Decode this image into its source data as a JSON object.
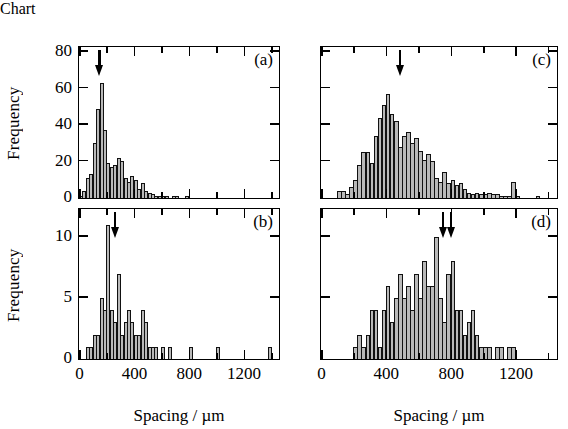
{
  "figure": {
    "xlabel": "Spacing / µm",
    "ylabel": "Frequency",
    "xticks": [
      "0",
      "400",
      "800",
      "1200"
    ],
    "xlim": [
      0,
      1450
    ],
    "ink_color": "#000000",
    "bar_fill": "#b9b9b9"
  },
  "axis_titles": {
    "left_x": "Spacing / µm",
    "right_x": "Spacing / µm",
    "top_left_y": "Frequency",
    "bottom_left_y": "Frequency"
  },
  "chart_data": [
    {
      "type": "bar",
      "panel": "a",
      "label": "(a)",
      "title": "",
      "xlabel": "Spacing / µm",
      "ylabel": "Frequency",
      "xlim": [
        0,
        1450
      ],
      "ylim": [
        0,
        82
      ],
      "xticks": [
        0,
        400,
        800,
        1200
      ],
      "xticks_minor": [
        200,
        600,
        1000,
        1400
      ],
      "yticks": [
        0,
        20,
        40,
        60,
        80
      ],
      "ytick_labels": [
        "0",
        "20",
        "40",
        "60",
        "80"
      ],
      "grid": false,
      "legend": null,
      "bin_width": 25,
      "annotation_arrows": [
        150
      ],
      "x": [
        25,
        50,
        75,
        100,
        125,
        150,
        175,
        200,
        225,
        250,
        275,
        300,
        325,
        350,
        375,
        400,
        425,
        450,
        475,
        500,
        525,
        550,
        575,
        600,
        625,
        650,
        675,
        700,
        725,
        750,
        775,
        800,
        825,
        850,
        875,
        900,
        925,
        950,
        975,
        1000,
        1025,
        1050,
        1075,
        1100,
        1125,
        1150,
        1175,
        1200
      ],
      "values": [
        1,
        4,
        11,
        13,
        30,
        49,
        63,
        37,
        19,
        17,
        18,
        22,
        20,
        11,
        9,
        12,
        10,
        5,
        8,
        4,
        3,
        2,
        1,
        1,
        1,
        1,
        0,
        1,
        1,
        0,
        0,
        1,
        0,
        0,
        0,
        0,
        0,
        0,
        0,
        0,
        0,
        0,
        0,
        0,
        0,
        0,
        0,
        0
      ]
    },
    {
      "type": "bar",
      "panel": "b",
      "label": "(b)",
      "title": "",
      "xlabel": "Spacing / µm",
      "ylabel": "Frequency",
      "xlim": [
        0,
        1450
      ],
      "ylim": [
        0,
        12.2
      ],
      "xticks": [
        0,
        400,
        800,
        1200
      ],
      "xticks_minor": [
        200,
        600,
        1000,
        1400
      ],
      "yticks": [
        0,
        5,
        10
      ],
      "ytick_labels": [
        "0",
        "5",
        "10"
      ],
      "grid": false,
      "legend": null,
      "bin_width": 25,
      "annotation_arrows": [
        265
      ],
      "x": [
        25,
        50,
        75,
        100,
        125,
        150,
        175,
        200,
        225,
        250,
        275,
        300,
        325,
        350,
        375,
        400,
        425,
        450,
        475,
        500,
        525,
        550,
        575,
        600,
        625,
        650,
        675,
        700,
        725,
        750,
        775,
        800,
        825,
        850,
        875,
        900,
        925,
        950,
        975,
        1000,
        1025,
        1050,
        1075,
        1100,
        1125,
        1150,
        1175,
        1200,
        1225,
        1250,
        1275,
        1300,
        1325,
        1350,
        1375,
        1400
      ],
      "values": [
        0,
        0,
        1,
        1,
        2,
        2,
        5,
        4,
        11,
        4,
        3,
        7,
        2,
        3,
        4,
        3,
        2,
        2,
        4,
        3,
        1,
        1,
        1,
        0,
        1,
        0,
        1,
        0,
        0,
        0,
        0,
        0,
        1,
        0,
        0,
        0,
        0,
        0,
        0,
        0,
        1,
        0,
        0,
        0,
        0,
        0,
        0,
        0,
        0,
        0,
        0,
        0,
        0,
        0,
        0,
        1
      ]
    },
    {
      "type": "bar",
      "panel": "c",
      "label": "(c)",
      "title": "",
      "xlabel": "Spacing / µm",
      "ylabel": "Frequency",
      "xlim": [
        0,
        1450
      ],
      "ylim": [
        0,
        82
      ],
      "xticks": [
        0,
        400,
        800,
        1200
      ],
      "xticks_minor": [
        200,
        600,
        1000,
        1400
      ],
      "yticks": [
        0,
        20,
        40,
        60,
        80
      ],
      "ytick_labels": [
        "0",
        "20",
        "40",
        "60",
        "80"
      ],
      "grid": false,
      "legend": null,
      "bin_width": 25,
      "annotation_arrows": [
        490
      ],
      "x": [
        125,
        150,
        175,
        200,
        225,
        250,
        275,
        300,
        325,
        350,
        375,
        400,
        425,
        450,
        475,
        500,
        525,
        550,
        575,
        600,
        625,
        650,
        675,
        700,
        725,
        750,
        775,
        800,
        825,
        850,
        875,
        900,
        925,
        950,
        975,
        1000,
        1025,
        1050,
        1075,
        1100,
        1125,
        1150,
        1175,
        1200,
        1225,
        1250,
        1275,
        1300,
        1325,
        1350
      ],
      "values": [
        4,
        4,
        2,
        6,
        10,
        18,
        25,
        25,
        19,
        34,
        44,
        51,
        57,
        46,
        42,
        28,
        34,
        36,
        30,
        33,
        26,
        21,
        24,
        20,
        11,
        9,
        14,
        8,
        10,
        7,
        8,
        5,
        3,
        2,
        3,
        2,
        2,
        3,
        2,
        2,
        1,
        1,
        1,
        9,
        1,
        0,
        0,
        0,
        0,
        1
      ]
    },
    {
      "type": "bar",
      "panel": "d",
      "label": "(d)",
      "title": "",
      "xlabel": "Spacing / µm",
      "ylabel": "Frequency",
      "xlim": [
        0,
        1450
      ],
      "ylim": [
        0,
        12.2
      ],
      "xticks": [
        0,
        400,
        800,
        1200
      ],
      "xticks_minor": [
        200,
        600,
        1000,
        1400
      ],
      "yticks": [
        0,
        5,
        10
      ],
      "ytick_labels": [
        "0",
        "5",
        "10"
      ],
      "grid": false,
      "legend": null,
      "bin_width": 25,
      "annotation_arrows": [
        755,
        805
      ],
      "x": [
        225,
        250,
        275,
        300,
        325,
        350,
        375,
        400,
        425,
        450,
        475,
        500,
        525,
        550,
        575,
        600,
        625,
        650,
        675,
        700,
        725,
        750,
        775,
        800,
        825,
        850,
        875,
        900,
        925,
        950,
        975,
        1000,
        1025,
        1050,
        1075,
        1100,
        1125,
        1150,
        1175,
        1200,
        1225,
        1250,
        1275,
        1300
      ],
      "values": [
        1,
        2,
        1,
        2,
        4,
        4,
        1,
        4,
        6,
        3,
        5,
        7,
        5,
        6,
        4,
        7,
        5,
        8,
        6,
        6,
        10,
        5,
        3,
        7,
        8,
        4,
        4,
        2,
        3,
        4,
        2,
        1,
        1,
        1,
        0,
        1,
        1,
        0,
        1,
        1,
        0,
        0,
        0,
        0
      ]
    }
  ]
}
